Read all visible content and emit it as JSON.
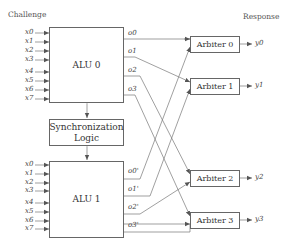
{
  "headers": {
    "left": "Challenge",
    "right": "Response"
  },
  "alu0": {
    "label": "ALU 0",
    "inputs": [
      "x0",
      "x1",
      "x2",
      "x3",
      "x4",
      "x5",
      "x6",
      "x7"
    ],
    "outputs": [
      "o0",
      "o1",
      "o2",
      "o3"
    ]
  },
  "sync": {
    "label_line1": "Synchronization",
    "label_line2": "Logic"
  },
  "alu1": {
    "label": "ALU 1",
    "inputs": [
      "x0",
      "x1",
      "x2",
      "x3",
      "x4",
      "x5",
      "x6",
      "x7"
    ],
    "outputs": [
      "o0'",
      "o1'",
      "o2'",
      "o3'"
    ]
  },
  "arbiters": [
    {
      "label": "Arbiter 0",
      "output": "y0"
    },
    {
      "label": "Arbiter 1",
      "output": "y1"
    },
    {
      "label": "Arbiter 2",
      "output": "y2"
    },
    {
      "label": "Arbiter 3",
      "output": "y3"
    }
  ],
  "connections": [
    {
      "from": "o0",
      "to": "Arbiter 0"
    },
    {
      "from": "o0'",
      "to": "Arbiter 0"
    },
    {
      "from": "o1",
      "to": "Arbiter 1"
    },
    {
      "from": "o1'",
      "to": "Arbiter 1"
    },
    {
      "from": "o2",
      "to": "Arbiter 2"
    },
    {
      "from": "o2'",
      "to": "Arbiter 2"
    },
    {
      "from": "o3",
      "to": "Arbiter 3"
    },
    {
      "from": "o3'",
      "to": "Arbiter 3"
    }
  ],
  "colors": {
    "line": "#666666",
    "text": "#333333"
  }
}
